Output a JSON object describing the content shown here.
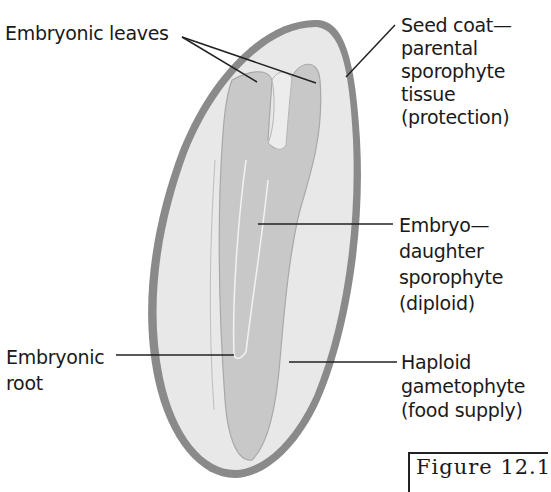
{
  "diagram": {
    "labels": {
      "embryonic_leaves": "Embryonic leaves",
      "seed_coat": [
        "Seed coat—",
        "parental",
        "sporophyte",
        "tissue",
        "(protection)"
      ],
      "embryo": [
        "Embryo—",
        "daughter",
        "sporophyte",
        "(diploid)"
      ],
      "embryonic_root": [
        "Embryonic",
        "root"
      ],
      "haploid": [
        "Haploid",
        "gametophyte",
        "(food supply)"
      ]
    },
    "figure_caption": "Figure 12.1",
    "colors": {
      "seed_coat": "#8a8a8a",
      "gametophyte": "#e6e6e6",
      "embryo": "#c6c6c6",
      "leader_line": "#222222",
      "text": "#1a1a1a"
    }
  }
}
